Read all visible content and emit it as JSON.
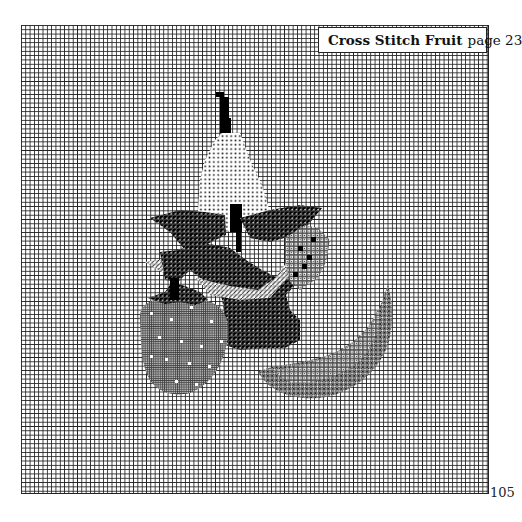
{
  "document": {
    "header": {
      "title": "Cross Stitch Fruit",
      "page_label": "page 23"
    },
    "page_number": "105",
    "chart": {
      "type": "cross-stitch-pattern",
      "subjects": [
        "pear",
        "grapes leaves",
        "strawberry",
        "orange slice"
      ],
      "grid": {
        "columns": 108,
        "rows": 108,
        "cell_px": 4.32
      }
    },
    "colors": {
      "grid_line": "#222222",
      "background": "#ffffff",
      "solid": "#000000"
    }
  }
}
